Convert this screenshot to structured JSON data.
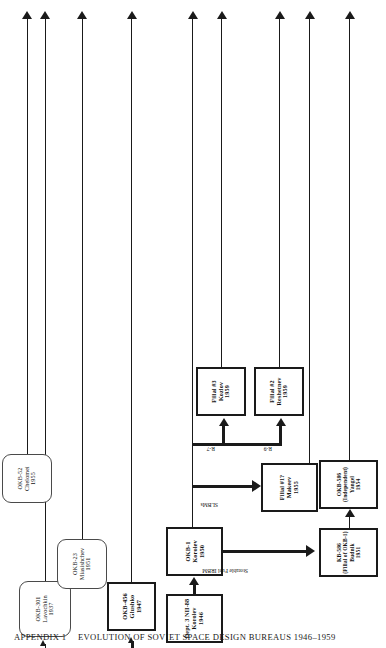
{
  "figure": {
    "appendix_label": "APPENDIX 1",
    "title": "EVOLUTION OF SOVIET SPACE DESIGN BUREAUS 1946–1959",
    "ink_color": "#1a1a1a",
    "background": "#ffffff"
  },
  "nodes": {
    "chelomei": {
      "name": "OKB-52",
      "person": "Chelomei",
      "year": "1955",
      "style": "rounded"
    },
    "miasishchev": {
      "name": "OKB-23",
      "person": "Miasishchev",
      "year": "1951",
      "style": "rounded"
    },
    "lavochkin": {
      "name": "OKB-301",
      "person": "Lavochkin",
      "year": "1937",
      "style": "rounded"
    },
    "glushko": {
      "name": "OKB-456",
      "person": "Glushko",
      "year": "1947",
      "style": "square"
    },
    "nii88": {
      "name": "Dept. 3 NII-88",
      "person": "Korolev",
      "year": "1946",
      "style": "square"
    },
    "okb1": {
      "name": "OKB-1",
      "person": "Korolev",
      "year": "1950",
      "style": "square"
    },
    "filial3": {
      "name": "Filial #3",
      "person": "Kozlov",
      "year": "1959",
      "style": "square"
    },
    "filial2": {
      "name": "Filial #2",
      "person": "Reshetnev",
      "year": "1959",
      "style": "square"
    },
    "filial1": {
      "name": "Filial #1?",
      "person": "Makeev",
      "year": "1955",
      "style": "square"
    },
    "kb586": {
      "name": "KB-586",
      "sub": "(Filial of OKB-1)",
      "person": "Budnik",
      "year": "1951",
      "style": "square"
    },
    "okb586": {
      "name": "OKB-586",
      "sub": "(Independent)",
      "person": "Yangel",
      "year": "1954",
      "style": "square"
    }
  },
  "edge_labels": {
    "storable_fuel": "Storable Fuel IRBM",
    "slbm": "SLBMs",
    "r7": "R-7",
    "r9": "R-9"
  }
}
